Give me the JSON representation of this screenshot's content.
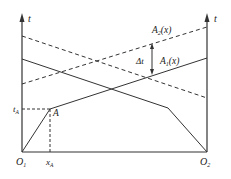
{
  "diagram": {
    "colors": {
      "line": "#333333",
      "background": "#ffffff"
    },
    "axes": {
      "left_axis_label": "t",
      "right_axis_label": "t",
      "left_origin_label": "O",
      "left_origin_sub": "1",
      "right_origin_label": "O",
      "right_origin_sub": "2"
    },
    "labels": {
      "a2": {
        "main": "A",
        "sub": "2",
        "arg": "(x)"
      },
      "a1": {
        "main": "A",
        "sub": "1",
        "arg": "(x)"
      },
      "delta_t": "Δt",
      "point_a": "A",
      "t_a": {
        "main": "t",
        "sub": "A"
      },
      "x_a": {
        "main": "x",
        "sub": "A"
      }
    }
  }
}
